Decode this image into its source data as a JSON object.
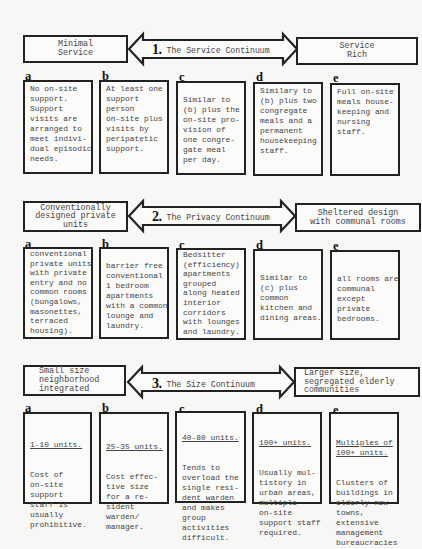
{
  "sections": [
    {
      "number": "1.",
      "title": "The Service Continuum",
      "left_label": "Minimal\nService",
      "right_label": "Service\nRich",
      "items": [
        {
          "letter": "a",
          "text": "No on-site\nsupport.\nSupport\nvisits are\narranged to\nmeet indivi-\ndual episodic\nneeds."
        },
        {
          "letter": "b",
          "text": "At least one\nsupport\nperson\non-site plus\nvisits by\nperipatetic\nsupport."
        },
        {
          "letter": "c",
          "text": "\nSimilar to\n(b) plus the\non-site pro-\nvision of\none congre-\ngate meal\nper day."
        },
        {
          "letter": "d",
          "text": "Similary to\n(b) plus two\ncongregate\nmeals and a\npermanent\nhousekeeping\nstaff."
        },
        {
          "letter": "e",
          "text": "Full on-site\nmeals house-\nkeeping and\nnursing\nstaff."
        }
      ]
    },
    {
      "number": "2.",
      "title": "The Privacy Continuum",
      "left_label": "Conventionally\ndesigned private\nunits",
      "right_label": "Sheltered design\nwith communal rooms",
      "items": [
        {
          "letter": "a",
          "text": "conventional\nprivate units\nwith private\nentry and no\ncommon rooms\n(bungalows,\nmasonettes,\nterraced\nhousing)."
        },
        {
          "letter": "b",
          "text": "\nbarrier free\nconventional\n1 bedroom\napartments\nwith a common\nlounge and\nlaundry."
        },
        {
          "letter": "c",
          "text": "Bedsitter\n(efficiency)\napartments\ngrouped\nalong heated\ninterior\ncorridors\nwith lounges\nand laundry."
        },
        {
          "letter": "d",
          "text": "\n\nSimilar to\n(c) plus\ncommon\nkitchen and\ndining areas."
        },
        {
          "letter": "e",
          "text": "\n\nall rooms are\ncommunal\nexcept\nprivate\nbedrooms."
        }
      ]
    },
    {
      "number": "3.",
      "title": "The Size Continuum",
      "left_label": "Small size\nneighborhood\nintegrated",
      "right_label": "Larger size,\nsegregated elderly\ncommunities",
      "items": [
        {
          "letter": "a",
          "heading": "1-10 units.",
          "text": "Cost of\non-site\nsupport\nstaff is\nusually\nprohibitive."
        },
        {
          "letter": "b",
          "heading": "25-35 units.",
          "text": "Cost effec-\ntive size\nfor a re-\nsident\nwarden/\nmanager."
        },
        {
          "letter": "c",
          "heading": "40-80 units.",
          "text": "Tends to\noverload the\nsingle resi-\ndent warden\nand makes\ngroup\nactivities\ndifficult."
        },
        {
          "letter": "d",
          "heading": "100+ units.",
          "text": "Usually mul-\ntistory in\nurban areas,\nmultiple\non-site\nsupport staff\nrequired."
        },
        {
          "letter": "e",
          "heading": "Multiples of\n100+ units.",
          "text": "Clusters of\nbuildings in\nelderly new\ntowns,\nextensive\nmanagement\nbureaucracies"
        }
      ]
    }
  ]
}
